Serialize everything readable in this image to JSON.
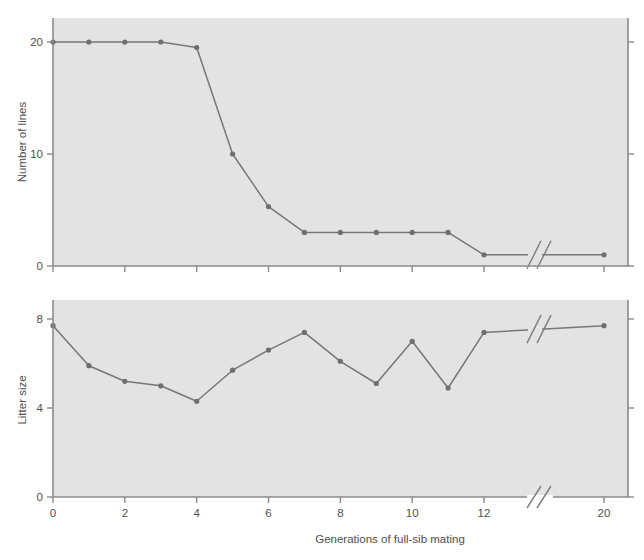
{
  "figure": {
    "background_color": "#ffffff",
    "plot_background_color": "#e3e3e3",
    "line_color": "#777777",
    "marker_color": "#6f6f6f",
    "axis_color": "#8a8a8a",
    "text_color": "#4f4f4f",
    "shared_xlabel": "Generations of full-sib mating",
    "x_tick_labels": [
      "0",
      "2",
      "4",
      "6",
      "8",
      "10",
      "12",
      "20"
    ],
    "x_tick_values": [
      0,
      2,
      4,
      6,
      8,
      10,
      12,
      20
    ],
    "axis_break_label": "//"
  },
  "chart_data": [
    {
      "type": "line",
      "title": "",
      "subtitle": "",
      "xlabel": "Generations of full-sib mating",
      "ylabel": "Number of lines",
      "x": [
        0,
        1,
        2,
        3,
        4,
        5,
        6,
        7,
        8,
        9,
        10,
        11,
        12,
        20
      ],
      "values": [
        20,
        20,
        20,
        20,
        19.5,
        10,
        5.3,
        3,
        3,
        3,
        3,
        3,
        1,
        1
      ],
      "xlim": [
        0,
        20
      ],
      "ylim": [
        0,
        21.5
      ],
      "ytick_labels": [
        "0",
        "10",
        "20"
      ],
      "ytick_values": [
        0,
        10,
        20
      ],
      "grid": false,
      "legend": "none",
      "axis_break_between": [
        12,
        20
      ],
      "markers": true
    },
    {
      "type": "line",
      "title": "",
      "subtitle": "",
      "xlabel": "Generations of full-sib mating",
      "ylabel": "Litter size",
      "x": [
        0,
        1,
        2,
        3,
        4,
        5,
        6,
        7,
        8,
        9,
        10,
        11,
        12,
        20
      ],
      "values": [
        7.7,
        5.9,
        5.2,
        5.0,
        4.3,
        5.7,
        6.6,
        7.4,
        6.1,
        5.1,
        7.0,
        4.9,
        7.4,
        7.7
      ],
      "xlim": [
        0,
        20
      ],
      "ylim": [
        0,
        8.6
      ],
      "ytick_labels": [
        "0",
        "4",
        "8"
      ],
      "ytick_values": [
        0,
        4,
        8
      ],
      "grid": false,
      "legend": "none",
      "axis_break_between": [
        12,
        20
      ],
      "markers": true
    }
  ]
}
